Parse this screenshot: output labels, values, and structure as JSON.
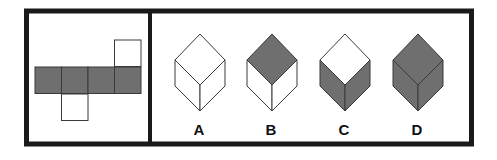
{
  "puzzle": {
    "colors": {
      "gray": "#6f6f6f",
      "white": "#ffffff",
      "line": "#3a3a3a",
      "frame": "#1a1a1a"
    },
    "net": {
      "description": "cube net: row of 4 gray squares, white square above 4th, white square below 2nd",
      "cells": [
        {
          "x": 35,
          "y": 67,
          "fill": "gray"
        },
        {
          "x": 61.5,
          "y": 67,
          "fill": "gray"
        },
        {
          "x": 88,
          "y": 67,
          "fill": "gray"
        },
        {
          "x": 114.5,
          "y": 67,
          "fill": "gray"
        },
        {
          "x": 114.5,
          "y": 40,
          "fill": "white"
        },
        {
          "x": 61.5,
          "y": 94,
          "fill": "white"
        }
      ],
      "cell_size": 26.5
    },
    "options": [
      {
        "label": "A",
        "cx": 200,
        "top": "white",
        "left": "white",
        "right": "white"
      },
      {
        "label": "B",
        "cx": 272,
        "top": "gray",
        "left": "white",
        "right": "white"
      },
      {
        "label": "C",
        "cx": 345,
        "top": "white",
        "left": "gray",
        "right": "gray"
      },
      {
        "label": "D",
        "cx": 418,
        "top": "gray",
        "left": "gray",
        "right": "gray"
      }
    ]
  }
}
